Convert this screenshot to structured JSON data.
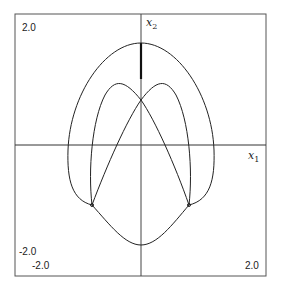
{
  "plot": {
    "type": "phase-portrait",
    "x_axis_label": "x",
    "x_axis_sub": "1",
    "y_axis_label": "x",
    "y_axis_sub": "2",
    "y_max_label": "2.0",
    "y_min_label": "-2.0",
    "x_min_label": "-2.0",
    "x_max_label": "2.0",
    "xlim": [
      -2.0,
      2.0
    ],
    "ylim": [
      -2.0,
      2.0
    ],
    "stroke_color": "#222222"
  }
}
